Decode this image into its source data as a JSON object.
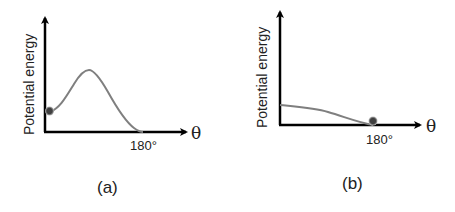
{
  "panels": [
    {
      "id": "a",
      "caption": "(a)",
      "ylabel": "Potential energy",
      "xlabel": "θ",
      "xtick": "180°",
      "description": "Curve starts low at 0° with ball at left minimum, rises to a barrier peak, then falls to zero at 180°"
    },
    {
      "id": "b",
      "caption": "(b)",
      "ylabel": "Potential energy",
      "xlabel": "θ",
      "xtick": "180°",
      "description": "Curve decreases monotonically from 0° to minimum at 180°, ball rests at 180°"
    }
  ],
  "colors": {
    "axis": "#000000",
    "curve": "#7f7f7f",
    "ball": "#404040"
  }
}
